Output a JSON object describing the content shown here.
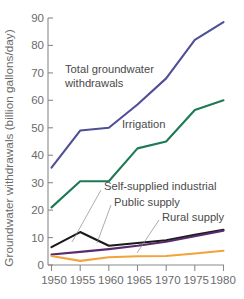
{
  "chart_data": {
    "type": "line",
    "title": "",
    "xlabel": "",
    "ylabel": "Groundwater withdrawals (billion gallons/day)",
    "xlim": [
      1950,
      1980
    ],
    "ylim": [
      0,
      90
    ],
    "grid": false,
    "legend_position": "inline-annotations",
    "x": [
      1950,
      1955,
      1960,
      1965,
      1970,
      1975,
      1980
    ],
    "xtick_labels": [
      "1950",
      "1955",
      "1960",
      "1965",
      "1970",
      "1975",
      "1980"
    ],
    "ytick_labels": [
      "0",
      "10",
      "20",
      "30",
      "40",
      "50",
      "60",
      "70",
      "80",
      "90"
    ],
    "ytick_values": [
      0,
      10,
      20,
      30,
      40,
      50,
      60,
      70,
      80,
      90
    ],
    "series": [
      {
        "name": "Total groundwater withdrawals",
        "color": "#4f4f96",
        "values": [
          35.5,
          49.0,
          50.0,
          58.5,
          68.0,
          82.0,
          88.5
        ]
      },
      {
        "name": "Irrigation",
        "color": "#1e7a55",
        "values": [
          21.0,
          30.5,
          30.5,
          42.5,
          45.0,
          56.5,
          60.0
        ]
      },
      {
        "name": "Self-supplied industrial",
        "color": "#1a1a1a",
        "values": [
          6.5,
          12.0,
          7.0,
          8.0,
          9.0,
          11.0,
          12.8
        ]
      },
      {
        "name": "Public supply",
        "color": "#5b2a6e",
        "values": [
          3.8,
          4.8,
          5.8,
          7.0,
          8.5,
          10.5,
          12.5
        ]
      },
      {
        "name": "Rural supply",
        "color": "#f2a33c",
        "values": [
          3.3,
          1.5,
          2.8,
          3.2,
          3.3,
          4.2,
          5.2
        ]
      }
    ],
    "annotations": [
      {
        "label": "Total groundwater",
        "series": "Total groundwater withdrawals"
      },
      {
        "label": "withdrawals",
        "series": "Total groundwater withdrawals"
      },
      {
        "label": "Irrigation",
        "series": "Irrigation"
      },
      {
        "label": "Self-supplied industrial",
        "series": "Self-supplied industrial"
      },
      {
        "label": "Public supply",
        "series": "Public supply"
      },
      {
        "label": "Rural supply",
        "series": "Rural supply"
      }
    ]
  },
  "axis": {
    "y_title": "Groundwater withdrawals (billion gallons/day)",
    "y_ticks": {
      "t90": "90",
      "t80": "80",
      "t70": "70",
      "t60": "60",
      "t50": "50",
      "t40": "40",
      "t30": "30",
      "t20": "20",
      "t10": "10",
      "t0": "0"
    },
    "x_ticks": {
      "t1950": "1950",
      "t1955": "1955",
      "t1960": "1960",
      "t1965": "1965",
      "t1970": "1970",
      "t1975": "1975",
      "t1980": "1980"
    }
  },
  "annotations": {
    "total_line1": "Total groundwater",
    "total_line2": "withdrawals",
    "irrigation": "Irrigation",
    "self_supplied_industrial": "Self-supplied industrial",
    "public_supply": "Public supply",
    "rural_supply": "Rural supply"
  },
  "colors": {
    "total": "#4f4f96",
    "irrigation": "#1e7a55",
    "industrial": "#1a1a1a",
    "public": "#5b2a6e",
    "rural": "#f2a33c",
    "axis": "#8a8a8a",
    "text": "#6b6b6b"
  }
}
